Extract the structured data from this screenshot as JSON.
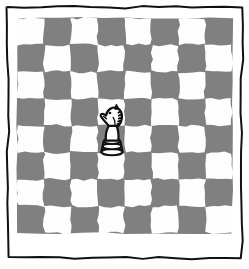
{
  "artwork": {
    "title": "Chessboard with single knight",
    "style": "hand-drawn line illustration",
    "background_color": "#ffffff",
    "frame": {
      "stroke_color": "#111111",
      "stroke_width": 2,
      "inset_left": 8,
      "inset_top": 7,
      "inset_right": 242,
      "inset_bottom": 258,
      "hand_drawn": true
    }
  },
  "board": {
    "rows": 8,
    "columns": 8,
    "origin_x": 17,
    "origin_y": 18,
    "square_size": 26.9,
    "light_square_color": "#fdfdfd",
    "dark_square_color": "#808080",
    "top_left_square_shade": "light",
    "edge_wobble": true,
    "column_labels": [
      "1",
      "2",
      "3",
      "4",
      "5",
      "6",
      "7",
      "8"
    ],
    "row_labels": [
      "1",
      "2",
      "3",
      "4",
      "5",
      "6",
      "7",
      "8"
    ]
  },
  "pieces": [
    {
      "type": "knight",
      "name": "white-knight",
      "color": "white",
      "outline_color": "#111111",
      "fill_color": "#fdfdfd",
      "column": 4,
      "row": 4,
      "center_x": 112,
      "center_y": 130,
      "height": 50,
      "width": 30,
      "notes": "head rests on dark square, base overlaps light square below"
    }
  ],
  "counts": {
    "total_squares": 64,
    "light_squares": 32,
    "dark_squares": 32,
    "pieces_on_board": 1
  }
}
